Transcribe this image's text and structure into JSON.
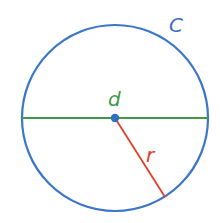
{
  "diagram": {
    "labels": {
      "circumference": "C",
      "diameter": "d",
      "radius": "r"
    },
    "colors": {
      "circle": "#3b76c9",
      "diameter": "#3f9a46",
      "radius": "#e0402e",
      "center": "#2f6fbf",
      "label_c": "#3b6fc2",
      "label_d": "#3f9a46",
      "label_r": "#e0402e"
    }
  }
}
